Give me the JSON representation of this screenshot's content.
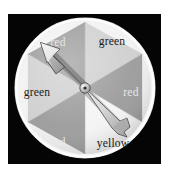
{
  "image": {
    "width": 170,
    "height": 180,
    "background_color": "#ffffff",
    "frame_color": "#050505",
    "title": "spinner"
  },
  "spinner": {
    "name": "six-segment-spinner",
    "center": {
      "x": 85,
      "y": 88
    },
    "radius": 70,
    "segment_count": 6,
    "segment_angle_deg": 60,
    "rim_color": "#f2f2f2",
    "divider_color": "#b8b8b8",
    "segments": [
      {
        "index": 0,
        "label": "red",
        "fill": "#9b9b9b",
        "text_color": "#e8e8e8",
        "start_angle_deg": 210,
        "end_angle_deg": 270,
        "label_x": 58,
        "label_y": 42
      },
      {
        "index": 1,
        "label": "green",
        "fill": "#cfcfcf",
        "text_color": "#1a1a1a",
        "start_angle_deg": 270,
        "end_angle_deg": 330,
        "label_x": 112,
        "label_y": 41
      },
      {
        "index": 2,
        "label": "red",
        "fill": "#9b9b9b",
        "text_color": "#e8e8e8",
        "start_angle_deg": 330,
        "end_angle_deg": 30,
        "label_x": 131,
        "label_y": 92
      },
      {
        "index": 3,
        "label": "yellow",
        "fill": "#f4f4f4",
        "text_color": "#262626",
        "start_angle_deg": 30,
        "end_angle_deg": 90,
        "label_x": 113,
        "label_y": 143
      },
      {
        "index": 4,
        "label": "red",
        "fill": "#9b9b9b",
        "text_color": "#e8e8e8",
        "start_angle_deg": 90,
        "end_angle_deg": 150,
        "label_x": 58,
        "label_y": 142
      },
      {
        "index": 5,
        "label": "green",
        "fill": "#cfcfcf",
        "text_color": "#1a1a1a",
        "start_angle_deg": 150,
        "end_angle_deg": 210,
        "label_x": 37,
        "label_y": 92
      }
    ],
    "pointer": {
      "name": "spinner-arrow",
      "direction": "up-left",
      "tip": {
        "x": 43,
        "y": 48
      },
      "tail": {
        "x": 126,
        "y": 126
      },
      "body_fill": "#d8d8d8",
      "shade_fill": "#a9a9a9",
      "outline": "#3a3a3a",
      "hub_fill": "#cccccc",
      "hub_pin": "#2b2b2b"
    }
  }
}
